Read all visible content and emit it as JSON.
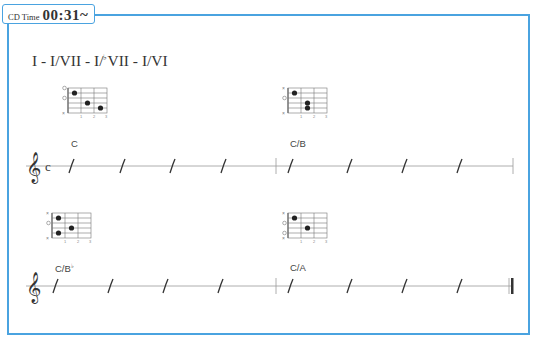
{
  "badge": {
    "label": "CD Time",
    "time": "00:31~"
  },
  "heading": {
    "pre": "I - I/VII - I/",
    "flat": "♭",
    "post": "VII - I/VI"
  },
  "colors": {
    "accent": "#4aa3e0",
    "ink": "#333333",
    "line": "#999999"
  },
  "systems": [
    {
      "time_signature": "c",
      "chords": [
        {
          "name": "C",
          "flat": "",
          "muted": [
            6
          ],
          "open": [
            1,
            3
          ],
          "dots": [
            {
              "string": 2,
              "fret": 1
            },
            {
              "string": 4,
              "fret": 2
            },
            {
              "string": 5,
              "fret": 3
            }
          ]
        },
        {
          "name": "C/B",
          "flat": "",
          "muted": [
            1,
            6
          ],
          "open": [
            3
          ],
          "dots": [
            {
              "string": 2,
              "fret": 1
            },
            {
              "string": 4,
              "fret": 2
            },
            {
              "string": 5,
              "fret": 2
            }
          ]
        }
      ],
      "beats_per_bar": 4,
      "end_barline": "single"
    },
    {
      "time_signature": "",
      "chords": [
        {
          "name": "C/B",
          "flat": "♭",
          "muted": [
            1,
            6
          ],
          "open": [
            3
          ],
          "dots": [
            {
              "string": 2,
              "fret": 1
            },
            {
              "string": 4,
              "fret": 2
            },
            {
              "string": 5,
              "fret": 1
            }
          ]
        },
        {
          "name": "C/A",
          "flat": "",
          "muted": [
            1,
            6
          ],
          "open": [
            3,
            5
          ],
          "dots": [
            {
              "string": 2,
              "fret": 1
            },
            {
              "string": 4,
              "fret": 2
            }
          ]
        }
      ],
      "beats_per_bar": 4,
      "end_barline": "final"
    }
  ],
  "fret_numbers": [
    "1",
    "2",
    "3"
  ]
}
